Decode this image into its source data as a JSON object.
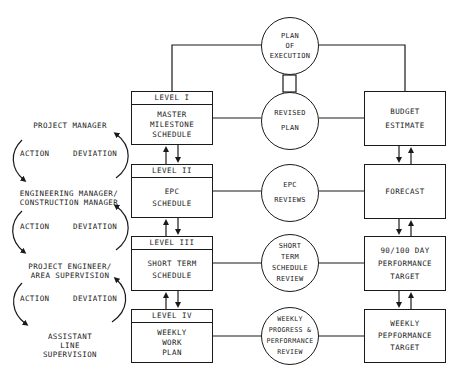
{
  "hierarchy": {
    "roles": [
      {
        "lines": [
          "PROJECT MANAGER"
        ]
      },
      {
        "lines": [
          "ENGINEERING MANAGER/",
          "CONSTRUCTION MANAGER"
        ]
      },
      {
        "lines": [
          "PROJECT ENGINEER/",
          "AREA SUPERVISION"
        ]
      },
      {
        "lines": [
          "ASSISTANT",
          "LINE",
          "SUPERVISION"
        ]
      }
    ],
    "cycles": [
      {
        "left": "ACTION",
        "right": "DEVIATION"
      },
      {
        "left": "ACTION",
        "right": "DEVIATION"
      },
      {
        "left": "ACTION",
        "right": "DEVIATION"
      }
    ]
  },
  "schedules": [
    {
      "level": "LEVEL I",
      "lines": [
        "MASTER",
        "MILESTONE",
        "SCHEDULE"
      ]
    },
    {
      "level": "LEVEL II",
      "lines": [
        "EPC",
        "SCHEDULE"
      ]
    },
    {
      "level": "LEVEL III",
      "lines": [
        "SHORT TERM",
        "SCHEDULE"
      ]
    },
    {
      "level": "LEVEL IV",
      "lines": [
        "WEEKLY",
        "WORK",
        "PLAN"
      ]
    }
  ],
  "reviews": [
    {
      "lines": [
        "PLAN",
        "OF",
        "EXECUTION"
      ]
    },
    {
      "lines": [
        "REVISED",
        "PLAN"
      ]
    },
    {
      "lines": [
        "EPC",
        "REVIEWS"
      ]
    },
    {
      "lines": [
        "SHORT",
        "TERM",
        "SCHEDULE",
        "REVIEW"
      ]
    },
    {
      "lines": [
        "WEEKLY",
        "PROGRESS &",
        "PERFORMANCE",
        "REVIEW"
      ]
    }
  ],
  "costs": [
    {
      "lines": [
        "BUDGET",
        "ESTIMATE"
      ]
    },
    {
      "lines": [
        "FORECAST"
      ]
    },
    {
      "lines": [
        "90/100 DAY",
        "PERFORMANCE",
        "TARGET"
      ]
    },
    {
      "lines": [
        "WEEKLY",
        "PEPFORMANCE",
        "TARGET"
      ]
    }
  ],
  "colors": {
    "ink": "#1a1a1a",
    "background": "#ffffff"
  }
}
